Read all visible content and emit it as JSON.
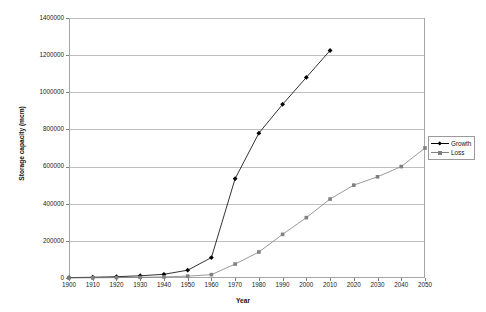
{
  "chart_data": {
    "type": "line",
    "title": "",
    "xlabel": "Year",
    "ylabel": "Storage capacity (mcm)",
    "xlim": [
      1900,
      2050
    ],
    "ylim": [
      0,
      1400000
    ],
    "grid": true,
    "legend_position": "right",
    "x": [
      1900,
      1910,
      1920,
      1930,
      1940,
      1950,
      1960,
      1970,
      1980,
      1990,
      2000,
      2010,
      2020,
      2030,
      2040,
      2050
    ],
    "xticks": [
      "1900",
      "1910",
      "1920",
      "1930",
      "1940",
      "1950",
      "1960",
      "1970",
      "1980",
      "1990",
      "2000",
      "2010",
      "2020",
      "2030",
      "2040",
      "2050"
    ],
    "yticks": [
      "0",
      "200000",
      "400000",
      "600000",
      "800000",
      "1000000",
      "1200000",
      "1400000"
    ],
    "ytick_values": [
      0,
      200000,
      400000,
      600000,
      800000,
      1000000,
      1200000,
      1400000
    ],
    "series": [
      {
        "name": "Growth",
        "color": "#000000",
        "marker": "diamond",
        "x": [
          1900,
          1910,
          1920,
          1930,
          1940,
          1950,
          1960,
          1970,
          1980,
          1990,
          2000,
          2010
        ],
        "values": [
          2000,
          4000,
          7000,
          12000,
          20000,
          42000,
          110000,
          535000,
          780000,
          935000,
          1080000,
          1225000
        ]
      },
      {
        "name": "Loss",
        "color": "#808080",
        "marker": "square",
        "x": [
          1900,
          1910,
          1920,
          1930,
          1940,
          1950,
          1960,
          1970,
          1980,
          1990,
          2000,
          2010,
          2020,
          2030,
          2040,
          2050
        ],
        "values": [
          500,
          1000,
          2000,
          3500,
          6000,
          10000,
          18000,
          75000,
          140000,
          235000,
          325000,
          425000,
          500000,
          545000,
          600000,
          700000
        ]
      }
    ]
  },
  "legend": {
    "items": [
      {
        "label": "Growth"
      },
      {
        "label": "Loss"
      }
    ]
  }
}
